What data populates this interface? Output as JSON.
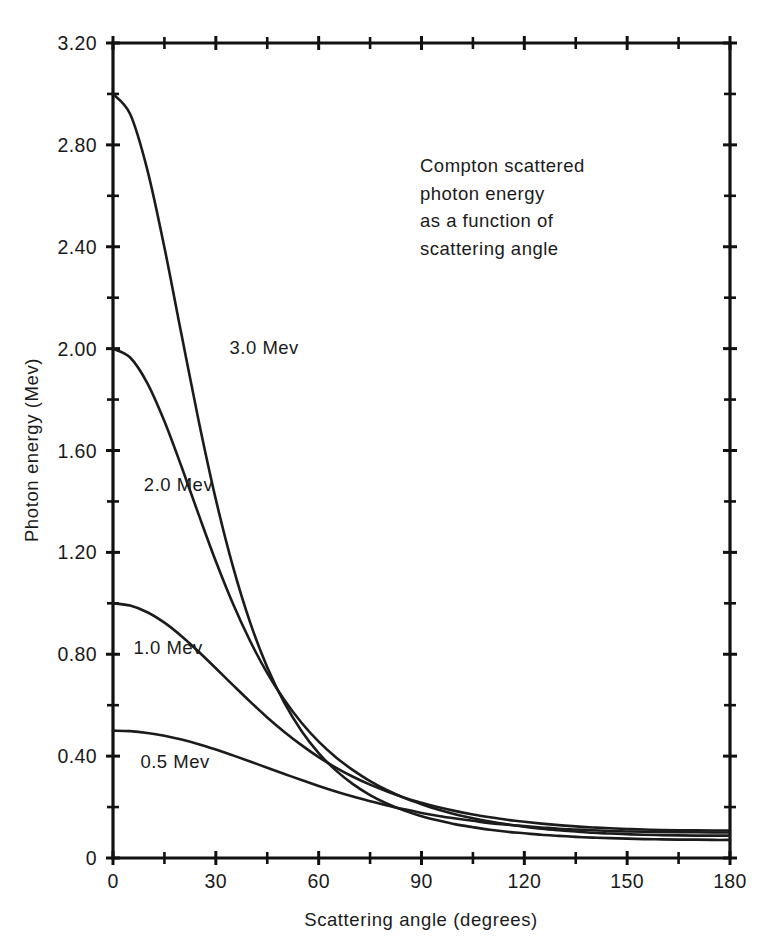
{
  "chart_data": {
    "type": "line",
    "title": "",
    "annotation": [
      "Compton scattered",
      "photon energy",
      "as a function of",
      "scattering angle"
    ],
    "xlabel": "Scattering angle (degrees)",
    "ylabel": "Photon energy (Mev)",
    "xlim": [
      0,
      180
    ],
    "ylim": [
      0,
      3.2
    ],
    "grid": false,
    "legend_position": "inline-curve-labels",
    "x_major_ticks": [
      0,
      30,
      60,
      90,
      120,
      150,
      180
    ],
    "x_major_tick_labels": [
      "0",
      "30",
      "60",
      "90",
      "120",
      "150",
      "180"
    ],
    "x_minor_tick_interval": 15,
    "y_major_ticks": [
      0,
      0.4,
      0.8,
      1.2,
      1.6,
      2.0,
      2.4,
      2.8,
      3.2
    ],
    "y_major_tick_labels": [
      "0",
      "0.40",
      "0.80",
      "1.20",
      "1.60",
      "2.00",
      "2.40",
      "2.80",
      "3.20"
    ],
    "y_minor_tick_interval": 0.2,
    "x": [
      0,
      5,
      10,
      15,
      20,
      25,
      30,
      35,
      40,
      45,
      50,
      55,
      60,
      65,
      70,
      75,
      80,
      85,
      90,
      95,
      100,
      105,
      110,
      115,
      120,
      125,
      130,
      135,
      140,
      145,
      150,
      155,
      160,
      165,
      170,
      175,
      180
    ],
    "series": [
      {
        "name": "3.0 Mev",
        "label": "3.0 Mev",
        "incident_energy": 3.0,
        "label_x": 34,
        "label_y": 1.98,
        "values": [
          3.0,
          2.921,
          2.703,
          2.397,
          2.054,
          1.716,
          1.408,
          1.144,
          0.925,
          0.749,
          0.609,
          0.499,
          0.412,
          0.344,
          0.29,
          0.247,
          0.213,
          0.186,
          0.164,
          0.147,
          0.132,
          0.121,
          0.111,
          0.103,
          0.097,
          0.091,
          0.087,
          0.083,
          0.08,
          0.078,
          0.076,
          0.074,
          0.073,
          0.072,
          0.072,
          0.071,
          0.071
        ]
      },
      {
        "name": "2.0 Mev",
        "label": "2.0 Mev",
        "incident_energy": 2.0,
        "label_x": 9,
        "label_y": 1.44,
        "values": [
          2.0,
          1.965,
          1.865,
          1.715,
          1.536,
          1.348,
          1.165,
          0.998,
          0.852,
          0.726,
          0.62,
          0.531,
          0.457,
          0.396,
          0.345,
          0.302,
          0.266,
          0.236,
          0.211,
          0.189,
          0.171,
          0.156,
          0.143,
          0.132,
          0.123,
          0.115,
          0.109,
          0.104,
          0.099,
          0.096,
          0.093,
          0.091,
          0.09,
          0.089,
          0.088,
          0.088,
          0.088
        ]
      },
      {
        "name": "1.0 Mev",
        "label": "1.0 Mev",
        "incident_energy": 1.0,
        "label_x": 6,
        "label_y": 0.8,
        "values": [
          1.0,
          0.991,
          0.965,
          0.924,
          0.871,
          0.81,
          0.745,
          0.679,
          0.614,
          0.552,
          0.495,
          0.443,
          0.396,
          0.355,
          0.319,
          0.288,
          0.261,
          0.237,
          0.217,
          0.199,
          0.184,
          0.171,
          0.16,
          0.15,
          0.142,
          0.135,
          0.129,
          0.124,
          0.12,
          0.117,
          0.114,
          0.112,
          0.11,
          0.109,
          0.109,
          0.108,
          0.108
        ]
      },
      {
        "name": "0.5 Mev",
        "label": "0.5 Mev",
        "incident_energy": 0.5,
        "label_x": 8,
        "label_y": 0.355,
        "values": [
          0.5,
          0.498,
          0.491,
          0.48,
          0.465,
          0.447,
          0.426,
          0.403,
          0.379,
          0.354,
          0.33,
          0.306,
          0.283,
          0.261,
          0.241,
          0.223,
          0.206,
          0.191,
          0.177,
          0.165,
          0.155,
          0.146,
          0.137,
          0.131,
          0.125,
          0.12,
          0.115,
          0.112,
          0.109,
          0.106,
          0.104,
          0.103,
          0.102,
          0.101,
          0.101,
          0.1,
          0.1
        ]
      }
    ]
  },
  "colors": {
    "axis": "#111111",
    "curve": "#1b1b1b",
    "text": "#1a1a1a",
    "background": "#ffffff"
  }
}
